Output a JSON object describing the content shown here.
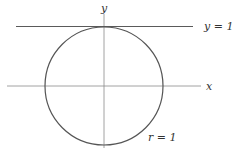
{
  "diagram": {
    "labels": {
      "y_axis": "y",
      "x_axis": "x",
      "tangent_line": "y = 1",
      "radius": "r = 1"
    },
    "geometry": {
      "center": [
        104,
        86
      ],
      "radius_px": 59,
      "x_axis": {
        "x1": 7,
        "x2": 201,
        "y": 86
      },
      "y_axis": {
        "x": 104,
        "y1": 14,
        "y2": 148
      },
      "tangent_line": {
        "x1": 16,
        "x2": 193,
        "y": 26
      }
    },
    "colors": {
      "axes": "#8a8a8a",
      "curve": "#555555",
      "text": "#333333"
    }
  }
}
